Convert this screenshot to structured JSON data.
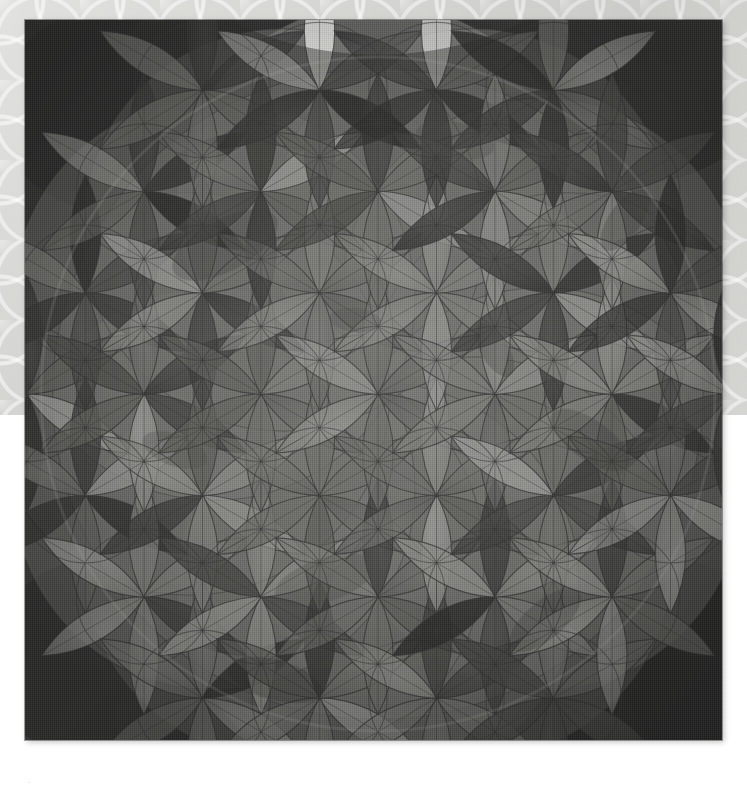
{
  "page": {
    "width": 747,
    "height": 794,
    "background_color": "#ffffff"
  },
  "wallpaper": {
    "name": "damask-circle-lattice",
    "base_color": "#d3d3d0",
    "line_color": "#f2f2f0",
    "band_height": 415
  },
  "artwork": {
    "title": "Flower of Life",
    "medium": "watercolor on canvas",
    "frame": {
      "x": 25,
      "y": 20,
      "width": 697,
      "height": 720
    },
    "background_color": "#2d2d2d",
    "line_color": "#3a3a3a",
    "geometry": {
      "type": "flower-of-life",
      "center_x": 378,
      "center_y": 394,
      "cell_radius": 68,
      "rosette_spacing": 117,
      "rosette_rings": 2,
      "outer_circle_rings": 1,
      "petals_per_rosette": 6
    },
    "palette": {
      "lightest": "#efefec",
      "light": "#d9d9d4",
      "mid_light": "#bdbdb8",
      "mid": "#a0a09b",
      "mid_dark": "#84847f",
      "dark": "#5a5a57",
      "darker": "#3d3d3b",
      "darkest": "#252524"
    },
    "artist_mark": "·"
  },
  "caption": {
    "text": ""
  }
}
